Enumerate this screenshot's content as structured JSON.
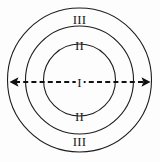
{
  "figure": {
    "name": "concentric-zones-diagram",
    "background_color": "#fdfdfd",
    "stroke_color": "#1d1d1d",
    "arrow_color": "#111111",
    "width": 160,
    "height": 162,
    "center": {
      "x": 79.5,
      "y": 80
    }
  },
  "rings": [
    {
      "id": "inner",
      "label": "I",
      "radius": 36
    },
    {
      "id": "middle",
      "label": "II",
      "radius": 54
    },
    {
      "id": "outer",
      "label": "III",
      "radius": 72
    }
  ],
  "labels": {
    "outer_top": "III",
    "middle_top": "II",
    "core": "I",
    "middle_bottom": "II",
    "outer_bottom": "III"
  },
  "axis": {
    "name": "horizontal-double-arrow",
    "style": "dashed",
    "x_start": 10,
    "x_end": 150,
    "y": 82
  }
}
